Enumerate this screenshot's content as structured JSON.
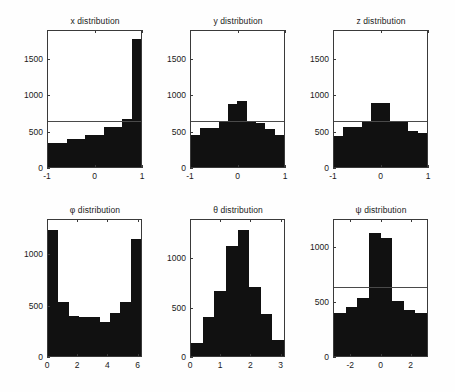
{
  "figure": {
    "background": "#fefefe",
    "bar_color": "#111111",
    "axis_color": "#3a3a3a",
    "refline_color": "#4a4a4a",
    "rows": 2,
    "cols": 3
  },
  "chart_data": [
    {
      "type": "bar",
      "id": "x-distribution",
      "title": "x distribution",
      "xlabel": "",
      "ylabel": "",
      "xlim": [
        -1,
        1
      ],
      "ylim": [
        0,
        1900
      ],
      "xticks": [
        -1,
        0,
        1
      ],
      "xtick_labels": [
        "-1",
        "0",
        "1"
      ],
      "yticks": [
        0,
        500,
        1000,
        1500
      ],
      "ytick_labels": [
        "0",
        "500",
        "1000",
        "1500"
      ],
      "grid": false,
      "legend": "none",
      "bin_edges": [
        -1,
        -0.8,
        -0.6,
        -0.4,
        -0.2,
        0,
        0.2,
        0.4,
        0.6,
        0.8,
        1
      ],
      "categories": [
        "-1.0:-0.8",
        "-0.8:-0.6",
        "-0.6:-0.4",
        "-0.4:-0.2",
        "-0.2:0.0",
        "0.0:0.2",
        "0.2:0.4",
        "0.4:0.6",
        "0.6:0.8",
        "0.8:1.0"
      ],
      "values": [
        330,
        330,
        385,
        385,
        450,
        450,
        560,
        560,
        670,
        1790
      ],
      "reference_line": 625,
      "annotations": [
        "horizontal reference line at y=625"
      ]
    },
    {
      "type": "bar",
      "id": "y-distribution",
      "title": "y distribution",
      "xlabel": "",
      "ylabel": "",
      "xlim": [
        -1,
        1
      ],
      "ylim": [
        0,
        1900
      ],
      "xticks": [
        -1,
        0,
        1
      ],
      "xtick_labels": [
        "-1",
        "0",
        "1"
      ],
      "yticks": [
        0,
        500,
        1000,
        1500
      ],
      "ytick_labels": [
        "0",
        "500",
        "1000",
        "1500"
      ],
      "grid": false,
      "legend": "none",
      "bin_edges": [
        -1,
        -0.8,
        -0.6,
        -0.4,
        -0.2,
        0,
        0.2,
        0.4,
        0.6,
        0.8,
        1
      ],
      "categories": [
        "-1.0:-0.8",
        "-0.8:-0.6",
        "-0.6:-0.4",
        "-0.4:-0.2",
        "-0.2:0.0",
        "0.0:0.2",
        "0.2:0.4",
        "0.4:0.6",
        "0.6:0.8",
        "0.8:1.0"
      ],
      "values": [
        445,
        540,
        540,
        625,
        880,
        925,
        625,
        610,
        525,
        450
      ],
      "reference_line": 625,
      "annotations": [
        "horizontal reference line at y=625"
      ]
    },
    {
      "type": "bar",
      "id": "z-distribution",
      "title": "z distribution",
      "xlabel": "",
      "ylabel": "",
      "xlim": [
        -1,
        1
      ],
      "ylim": [
        0,
        1900
      ],
      "xticks": [
        -1,
        0,
        1
      ],
      "xtick_labels": [
        "-1",
        "0",
        "1"
      ],
      "yticks": [
        0,
        500,
        1000,
        1500
      ],
      "ytick_labels": [
        "0",
        "500",
        "1000",
        "1500"
      ],
      "grid": false,
      "legend": "none",
      "bin_edges": [
        -1,
        -0.8,
        -0.6,
        -0.4,
        -0.2,
        0,
        0.2,
        0.4,
        0.6,
        0.8,
        1
      ],
      "categories": [
        "-1.0:-0.8",
        "-0.8:-0.6",
        "-0.6:-0.4",
        "-0.4:-0.2",
        "-0.2:0.0",
        "0.0:0.2",
        "0.2:0.4",
        "0.4:0.6",
        "0.6:0.8",
        "0.8:1.0"
      ],
      "values": [
        440,
        555,
        555,
        625,
        900,
        900,
        625,
        625,
        500,
        470
      ],
      "reference_line": 625,
      "annotations": [
        "horizontal reference line at y=625"
      ]
    },
    {
      "type": "bar",
      "id": "phi-distribution",
      "title": "φ distribution",
      "xlabel": "",
      "ylabel": "",
      "xlim": [
        0,
        6.2832
      ],
      "ylim": [
        0,
        1340
      ],
      "xticks": [
        0,
        2,
        4,
        6
      ],
      "xtick_labels": [
        "0",
        "2",
        "4",
        "6"
      ],
      "yticks": [
        0,
        500,
        1000
      ],
      "ytick_labels": [
        "0",
        "500",
        "1000"
      ],
      "grid": false,
      "legend": "none",
      "bin_edges": [
        0,
        0.6981,
        1.3963,
        2.0944,
        2.7925,
        3.4907,
        4.1888,
        4.8869,
        5.5851,
        6.2832
      ],
      "categories": [
        "0.00:0.70",
        "0.70:1.40",
        "1.40:2.09",
        "2.09:2.79",
        "2.79:3.49",
        "3.49:4.19",
        "4.19:4.89",
        "4.89:5.59",
        "5.59:6.28"
      ],
      "values": [
        1245,
        535,
        390,
        385,
        380,
        340,
        420,
        535,
        1155
      ],
      "reference_line": null,
      "annotations": []
    },
    {
      "type": "bar",
      "id": "theta-distribution",
      "title": "θ distribution",
      "xlabel": "",
      "ylabel": "",
      "xlim": [
        0,
        3.1416
      ],
      "ylim": [
        0,
        1400
      ],
      "xticks": [
        0,
        1,
        2,
        3
      ],
      "xtick_labels": [
        "0",
        "1",
        "2",
        "3"
      ],
      "yticks": [
        0,
        500,
        1000
      ],
      "ytick_labels": [
        "0",
        "500",
        "1000"
      ],
      "grid": false,
      "legend": "none",
      "bin_edges": [
        0,
        0.3927,
        0.7854,
        1.1781,
        1.5708,
        1.9635,
        2.3562,
        2.7489,
        3.1416
      ],
      "categories": [
        "0.00:0.39",
        "0.39:0.79",
        "0.79:1.18",
        "1.18:1.57",
        "1.57:1.96",
        "1.96:2.36",
        "2.36:2.75",
        "2.75:3.14"
      ],
      "values": [
        135,
        400,
        665,
        1130,
        1295,
        715,
        430,
        170
      ],
      "reference_line": null,
      "annotations": []
    },
    {
      "type": "bar",
      "id": "psi-distribution",
      "title": "ψ distribution",
      "xlabel": "",
      "ylabel": "",
      "xlim": [
        -3.1416,
        3.1416
      ],
      "ylim": [
        0,
        1260
      ],
      "xticks": [
        -2,
        0,
        2
      ],
      "xtick_labels": [
        "-2",
        "0",
        "2"
      ],
      "yticks": [
        0,
        500,
        1000
      ],
      "ytick_labels": [
        "0",
        "500",
        "1000"
      ],
      "grid": false,
      "legend": "none",
      "bin_edges": [
        -3.1416,
        -2.3562,
        -1.5708,
        -0.7854,
        0,
        0.7854,
        1.5708,
        2.3562,
        3.1416
      ],
      "categories": [
        "-3.14:-2.36",
        "-2.36:-1.57",
        "-1.57:-0.79",
        "-0.79:0.00",
        "0.00:0.79",
        "0.79:1.57",
        "1.57:2.36",
        "2.36:3.14"
      ],
      "values": [
        400,
        455,
        540,
        1140,
        1095,
        510,
        430,
        395
      ],
      "reference_line": 625,
      "annotations": [
        "horizontal reference line at y=625"
      ]
    }
  ]
}
